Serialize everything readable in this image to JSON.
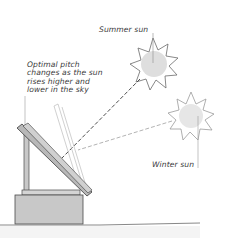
{
  "diagram": {
    "labels": {
      "summer_sun": "Summer sun",
      "optimal_pitch": "Optimal pitch\nchanges as the sun\nrises higher and\nlower in the sky",
      "winter_sun": "Winter sun"
    },
    "elements": [
      {
        "name": "summer-sun",
        "shape": "sun",
        "cx": 153,
        "cy": 63
      },
      {
        "name": "winter-sun",
        "shape": "sun",
        "cx": 190,
        "cy": 115
      },
      {
        "name": "solar-panel",
        "shape": "tilted-panel"
      },
      {
        "name": "support-box",
        "shape": "box"
      },
      {
        "name": "ground-line",
        "shape": "line"
      }
    ],
    "colors": {
      "sun_fill": "#dedede",
      "box_fill": "#c8c8c8",
      "panel_fill": "#b8b8b8",
      "line": "#3a3a3a",
      "light_line": "#b0b0b0"
    }
  }
}
